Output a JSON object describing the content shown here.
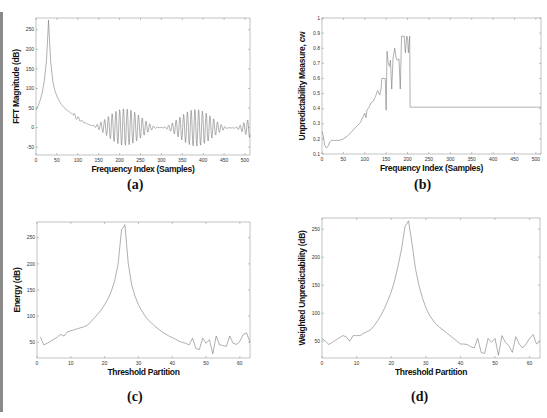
{
  "figure": {
    "captions": [
      "(a)",
      "(b)",
      "(c)",
      "(d)"
    ]
  },
  "chart_data": [
    {
      "id": "a",
      "type": "line",
      "title": "",
      "xlabel": "Frequency Index (Samples)",
      "ylabel": "FFT Magnitude (dB)",
      "xlim": [
        0,
        512
      ],
      "ylim": [
        -70,
        280
      ],
      "xticks": [
        0,
        50,
        100,
        150,
        200,
        250,
        300,
        350,
        400,
        450,
        500
      ],
      "yticks": [
        -50,
        0,
        50,
        100,
        150,
        200,
        250
      ],
      "grid": false,
      "box": {
        "x": 36,
        "y": 18,
        "w": 214,
        "h": 137
      },
      "description": "Sharp peak ~275 dB near index 30, decaying to ~0 dB by index 150, then oscillating between about -50 and 55 dB",
      "series": [
        {
          "name": "FFT magnitude",
          "x": [
            0,
            5,
            10,
            15,
            20,
            25,
            28,
            30,
            32,
            35,
            40,
            45,
            50,
            55,
            60,
            70,
            80,
            90,
            100,
            110,
            120,
            130,
            140,
            150,
            160,
            170,
            180,
            190,
            200,
            220,
            240,
            260,
            280,
            300,
            320,
            340,
            360,
            380,
            400,
            420,
            440,
            460,
            480,
            500,
            512
          ],
          "y": [
            45,
            55,
            70,
            90,
            120,
            170,
            230,
            275,
            230,
            170,
            120,
            95,
            80,
            70,
            60,
            48,
            40,
            32,
            28,
            22,
            18,
            12,
            8,
            5,
            2,
            0,
            -3,
            -5,
            -8,
            -12,
            -15,
            -18,
            -20,
            -22,
            -24,
            -25,
            -26,
            -27,
            -28,
            -28,
            -29,
            -30,
            -30,
            -30,
            -30
          ]
        }
      ],
      "oscillation": {
        "start": 90,
        "period": 9,
        "amplitude_high": 55,
        "amplitude_low": -50
      }
    },
    {
      "id": "b",
      "type": "line",
      "title": "",
      "xlabel": "Frequency Index (Samples)",
      "ylabel": "Unpredictability Measure, cw",
      "xlim": [
        0,
        512
      ],
      "ylim": [
        0.1,
        1.0
      ],
      "xticks": [
        0,
        50,
        100,
        150,
        200,
        250,
        300,
        350,
        400,
        450,
        500
      ],
      "yticks": [
        0.1,
        0.2,
        0.3,
        0.4,
        0.5,
        0.6,
        0.7,
        0.8,
        0.9,
        1
      ],
      "grid": false,
      "box": {
        "x": 322,
        "y": 18,
        "w": 219,
        "h": 136
      },
      "series": [
        {
          "name": "cw",
          "x": [
            0,
            3,
            6,
            10,
            14,
            18,
            22,
            26,
            30,
            40,
            50,
            60,
            70,
            80,
            90,
            95,
            100,
            103,
            105,
            110,
            115,
            120,
            125,
            130,
            135,
            138,
            140,
            145,
            148,
            150,
            152,
            155,
            158,
            160,
            163,
            166,
            170,
            173,
            176,
            180,
            183,
            186,
            188,
            190,
            192,
            195,
            198,
            200,
            202,
            205,
            206,
            512
          ],
          "y": [
            0.25,
            0.22,
            0.16,
            0.14,
            0.15,
            0.18,
            0.19,
            0.19,
            0.19,
            0.19,
            0.2,
            0.22,
            0.25,
            0.28,
            0.31,
            0.34,
            0.37,
            0.34,
            0.39,
            0.41,
            0.44,
            0.45,
            0.48,
            0.52,
            0.49,
            0.53,
            0.6,
            0.6,
            0.6,
            0.39,
            0.78,
            0.7,
            0.68,
            0.72,
            0.53,
            0.73,
            0.8,
            0.74,
            0.72,
            0.73,
            0.53,
            0.88,
            0.88,
            0.88,
            0.88,
            0.77,
            0.88,
            0.87,
            0.77,
            0.88,
            0.41,
            0.41
          ]
        }
      ]
    },
    {
      "id": "c",
      "type": "line",
      "title": "",
      "xlabel": "Threshold Partition",
      "ylabel": "Energy (dB)",
      "xlim": [
        0,
        63
      ],
      "ylim": [
        20,
        280
      ],
      "xticks": [
        0,
        10,
        20,
        30,
        40,
        50,
        60
      ],
      "yticks": [
        50,
        100,
        150,
        200,
        250
      ],
      "grid": false,
      "box": {
        "x": 37,
        "y": 222,
        "w": 213,
        "h": 136
      },
      "series": [
        {
          "name": "Energy",
          "x": [
            1,
            2,
            3,
            4,
            5,
            6,
            7,
            8,
            9,
            10,
            11,
            12,
            13,
            14,
            15,
            16,
            17,
            18,
            19,
            20,
            21,
            22,
            23,
            24,
            25,
            26,
            27,
            28,
            29,
            30,
            31,
            32,
            33,
            34,
            35,
            36,
            37,
            38,
            39,
            40,
            41,
            42,
            43,
            44,
            45,
            46,
            47,
            48,
            49,
            50,
            51,
            52,
            53,
            54,
            55,
            56,
            57,
            58,
            59,
            60,
            61,
            62,
            63
          ],
          "y": [
            60,
            45,
            48,
            52,
            56,
            60,
            65,
            62,
            70,
            72,
            74,
            76,
            78,
            80,
            83,
            90,
            97,
            104,
            112,
            122,
            133,
            148,
            168,
            200,
            265,
            275,
            200,
            160,
            138,
            122,
            110,
            100,
            92,
            86,
            80,
            75,
            70,
            66,
            62,
            59,
            56,
            52,
            50,
            48,
            45,
            58,
            38,
            36,
            58,
            48,
            55,
            28,
            62,
            45,
            44,
            42,
            62,
            48,
            46,
            52,
            65,
            68,
            50
          ]
        }
      ]
    },
    {
      "id": "d",
      "type": "line",
      "title": "",
      "xlabel": "Threshold Partition",
      "ylabel": "Weighted Unpredictability (dB)",
      "xlim": [
        0,
        63
      ],
      "ylim": [
        20,
        270
      ],
      "xticks": [
        0,
        10,
        20,
        30,
        40,
        50,
        60
      ],
      "yticks": [
        50,
        100,
        150,
        200,
        250
      ],
      "grid": false,
      "box": {
        "x": 322,
        "y": 218,
        "w": 218,
        "h": 140
      },
      "series": [
        {
          "name": "Weighted unpredictability",
          "x": [
            0,
            1,
            2,
            3,
            4,
            5,
            6,
            7,
            8,
            9,
            10,
            11,
            12,
            13,
            14,
            15,
            16,
            17,
            18,
            19,
            20,
            21,
            22,
            23,
            24,
            25,
            26,
            27,
            28,
            29,
            30,
            31,
            32,
            33,
            34,
            35,
            36,
            37,
            38,
            39,
            40,
            41,
            42,
            43,
            44,
            45,
            46,
            47,
            48,
            49,
            50,
            51,
            52,
            53,
            54,
            55,
            56,
            57,
            58,
            59,
            60,
            61,
            62,
            63
          ],
          "y": [
            55,
            50,
            44,
            48,
            52,
            56,
            60,
            58,
            50,
            60,
            60,
            60,
            64,
            67,
            70,
            77,
            86,
            96,
            108,
            122,
            138,
            158,
            185,
            215,
            255,
            265,
            225,
            180,
            150,
            128,
            110,
            97,
            88,
            80,
            75,
            70,
            65,
            60,
            55,
            50,
            45,
            45,
            44,
            40,
            38,
            55,
            30,
            28,
            55,
            48,
            55,
            25,
            60,
            48,
            42,
            30,
            58,
            45,
            38,
            45,
            55,
            62,
            45,
            50
          ]
        }
      ]
    }
  ]
}
